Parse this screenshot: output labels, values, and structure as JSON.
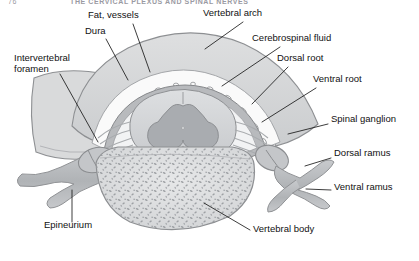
{
  "page": {
    "running_head_number": "76",
    "running_head_title": "THE CERVICAL PLEXUS AND SPINAL NERVES",
    "background_color": "#ffffff"
  },
  "figure": {
    "orientation": "axial/transverse section",
    "palette": {
      "ink": "#111111",
      "leader_line": "#1a1a1a",
      "bone_fill": "#d9dadb",
      "bone_edge": "#8d8f92",
      "white_matter": "#d4d6d8",
      "gray_matter": "#a9acb0",
      "dura": "#b8babd",
      "csf_space": "#f2f3f4",
      "nerve": "#b6b8bb",
      "epidural_fat": "#fafafa",
      "trabecular_speckle": "#9a9da1"
    },
    "labels": [
      {
        "id": "fat-vessels",
        "text": "Fat, vessels",
        "x": 88,
        "y": 14,
        "anchor_x": 148,
        "anchor_y": 72
      },
      {
        "id": "dura",
        "text": "Dura",
        "x": 85,
        "y": 30,
        "anchor_x": 132,
        "anchor_y": 79
      },
      {
        "id": "vertebral-arch",
        "text": "Vertebral arch",
        "x": 203,
        "y": 12,
        "anchor_x": 196,
        "anchor_y": 46
      },
      {
        "id": "cerebrospinal-fluid",
        "text": "Cerebrospinal fluid",
        "x": 252,
        "y": 37,
        "anchor_x": 216,
        "anchor_y": 84
      },
      {
        "id": "dorsal-root",
        "text": "Dorsal root",
        "x": 275,
        "y": 57,
        "anchor_x": 244,
        "anchor_y": 100
      },
      {
        "id": "ventral-root",
        "text": "Ventral root",
        "x": 312,
        "y": 78,
        "anchor_x": 252,
        "anchor_y": 120
      },
      {
        "id": "spinal-ganglion",
        "text": "Spinal ganglion",
        "x": 330,
        "y": 118,
        "anchor_x": 278,
        "anchor_y": 130
      },
      {
        "id": "dorsal-ramus",
        "text": "Dorsal ramus",
        "x": 333,
        "y": 152,
        "anchor_x": 300,
        "anchor_y": 163
      },
      {
        "id": "ventral-ramus",
        "text": "Ventral ramus",
        "x": 333,
        "y": 186,
        "anchor_x": 303,
        "anchor_y": 186
      },
      {
        "id": "vertebral-body",
        "text": "Vertebral body",
        "x": 253,
        "y": 228,
        "anchor_x": 205,
        "anchor_y": 203
      },
      {
        "id": "epineurium",
        "text": "Epineurium",
        "x": 44,
        "y": 224,
        "anchor_x": 70,
        "anchor_y": 190
      },
      {
        "id": "intervertebral-foramen",
        "text": "Intervertebral foramen",
        "x": 14,
        "y": 57,
        "anchor_x": 96,
        "anchor_y": 140
      }
    ]
  }
}
